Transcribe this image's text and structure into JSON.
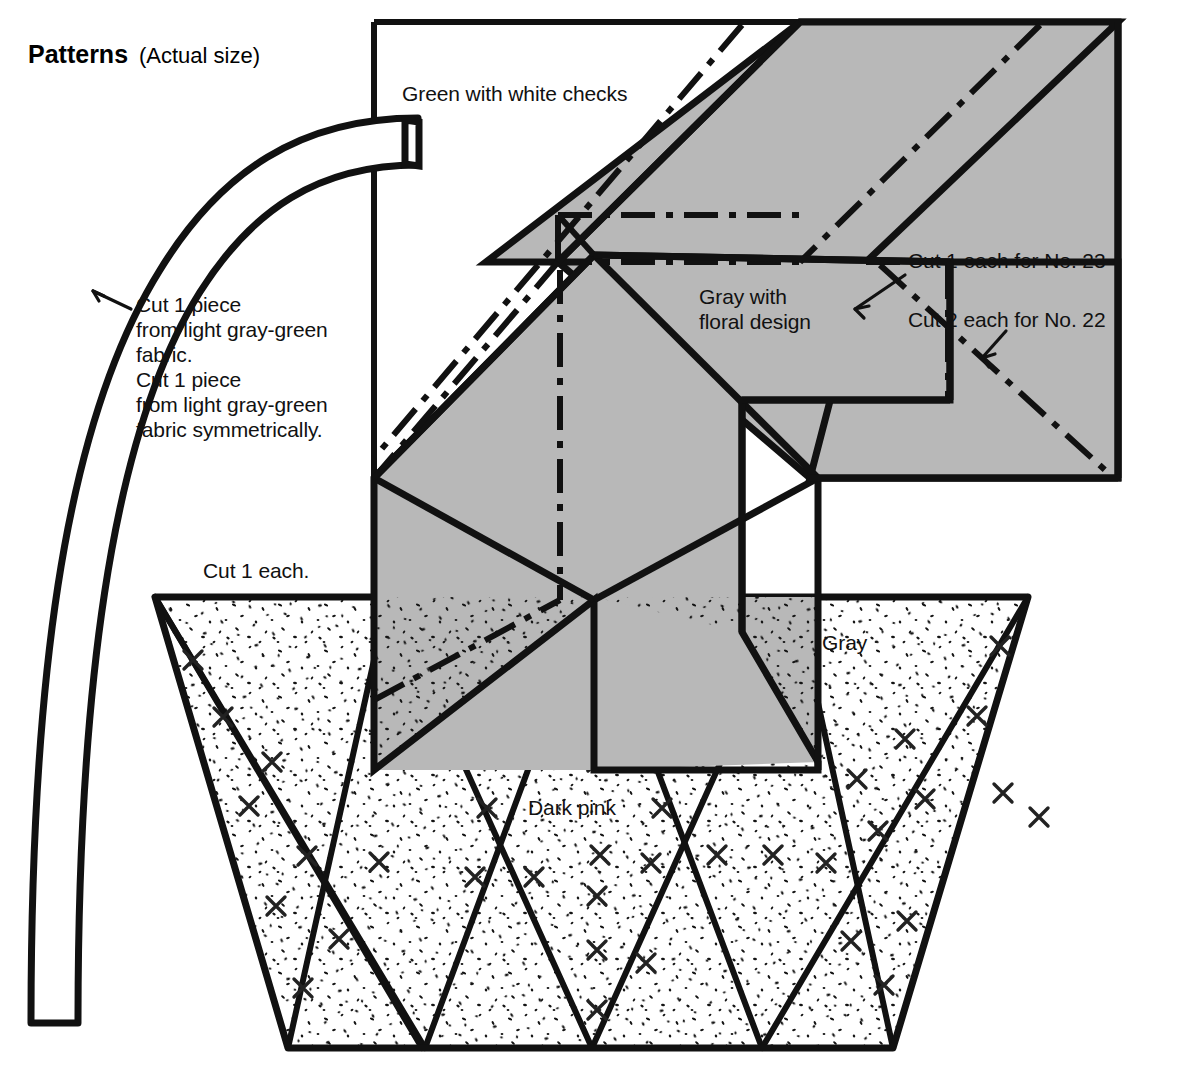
{
  "document": {
    "title_bold": "Patterns",
    "title_plain": "(Actual size)"
  },
  "labels": {
    "green_checks": "Green with white checks",
    "gray_floral_line1": "Gray with",
    "gray_floral_line2": "floral design",
    "cut_1_each_no23": "Cut 1 each for No. 23",
    "cut_2_each_no22": "Cut 2 each for No. 22",
    "cut_1_each": "Cut 1 each.",
    "gray": "Gray",
    "dark_pink": "Dark pink",
    "cut_piece_block": "Cut 1 piece\nfrom light gray-green\nfabric.\nCut 1 piece\nfrom light gray-green\nfabric symmetrically."
  },
  "colors": {
    "ink": "#000000",
    "gray_fill": "#b8b8b8",
    "paper": "#ffffff",
    "stipple": "#1a1a1a"
  },
  "pattern_pieces": [
    {
      "name": "handle-strip",
      "fabric": "light gray-green",
      "quantity": "Cut 1 piece / Cut 1 piece symmetrically"
    },
    {
      "name": "green-check-panel",
      "fabric": "Green with white checks",
      "quantity": "Cut 1 each for No. 23"
    },
    {
      "name": "gray-floral-panel",
      "fabric": "Gray with floral design",
      "quantity": "Cut 2 each for No. 22"
    },
    {
      "name": "basket-trapezoid",
      "fabric": "Gray / Dark pink",
      "quantity": "Cut 1 each."
    }
  ]
}
